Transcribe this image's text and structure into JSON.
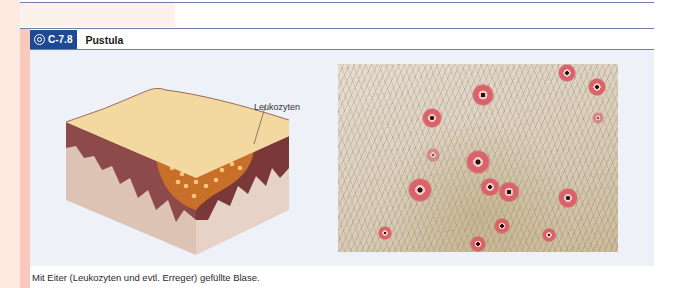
{
  "figure": {
    "id": "C-7.8",
    "title": "Pustula",
    "icon": "target-circle-icon",
    "badge_color": "#1e4a93",
    "illustration": {
      "label": "Leukozyten"
    },
    "photo": {
      "description": "Pustules on hairy skin"
    },
    "caption": "Mit Eiter (Leukozyten und evtl. Erreger) gefüllte Blase."
  }
}
